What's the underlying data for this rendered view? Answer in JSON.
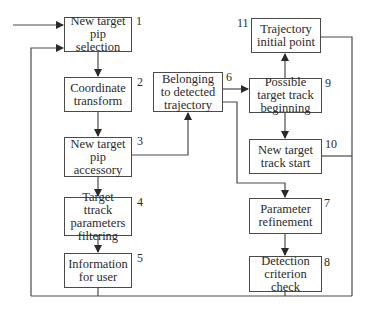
{
  "diagram": {
    "nodes": [
      {
        "id": "1",
        "label": "New target pip selection",
        "number": "1"
      },
      {
        "id": "2",
        "label": "Coordinate transform",
        "number": "2"
      },
      {
        "id": "3",
        "label": "New target pip accessory",
        "number": "3"
      },
      {
        "id": "4",
        "label": "Target ttrack parameters filtering",
        "number": "4"
      },
      {
        "id": "5",
        "label": "Information for user",
        "number": "5"
      },
      {
        "id": "6",
        "label": "Belonging to detected trajectory",
        "number": "6"
      },
      {
        "id": "7",
        "label": "Parameter refinement",
        "number": "7"
      },
      {
        "id": "8",
        "label": "Detection criterion check",
        "number": "8"
      },
      {
        "id": "9",
        "label": "Possible target track beginning",
        "number": "9"
      },
      {
        "id": "10",
        "label": "New target track start",
        "number": "10"
      },
      {
        "id": "11",
        "label": "Trajectory initial point",
        "number": "11"
      }
    ],
    "edges": [
      {
        "from": "input",
        "to": "1"
      },
      {
        "from": "1",
        "to": "2"
      },
      {
        "from": "2",
        "to": "3"
      },
      {
        "from": "3",
        "to": "4"
      },
      {
        "from": "3",
        "to": "6"
      },
      {
        "from": "4",
        "to": "5"
      },
      {
        "from": "6",
        "to": "9"
      },
      {
        "from": "6",
        "to": "7"
      },
      {
        "from": "9",
        "to": "11"
      },
      {
        "from": "9",
        "to": "10"
      },
      {
        "from": "7",
        "to": "8"
      },
      {
        "from": "5",
        "to": "1",
        "note": "feedback loop"
      },
      {
        "from": "8",
        "to": "1",
        "note": "feedback loop"
      },
      {
        "from": "10",
        "to": "1",
        "note": "feedback loop"
      },
      {
        "from": "11",
        "to": "1",
        "note": "feedback loop"
      }
    ]
  }
}
